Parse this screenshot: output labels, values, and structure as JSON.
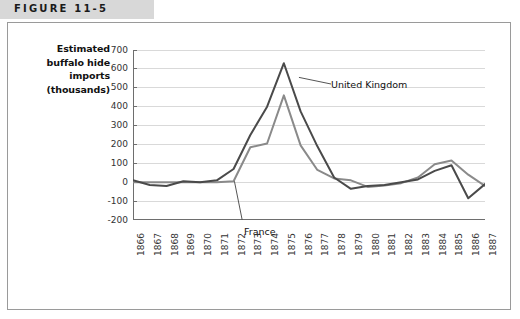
{
  "figure": {
    "label": "FIGURE 11-5"
  },
  "chart_data": {
    "type": "line",
    "title": "",
    "xlabel": "",
    "ylabel": "Estimated buffalo hide imports (thousands)",
    "ylabel_lines": [
      "Estimated",
      "buffalo hide",
      "imports",
      "(thousands)"
    ],
    "categories": [
      "1866",
      "1867",
      "1868",
      "1869",
      "1870",
      "1871",
      "1872",
      "1873",
      "1874",
      "1875",
      "1876",
      "1877",
      "1878",
      "1879",
      "1880",
      "1881",
      "1882",
      "1883",
      "1884",
      "1885",
      "1886",
      "1887"
    ],
    "yticks": [
      700,
      600,
      500,
      400,
      300,
      200,
      100,
      0,
      -100,
      -200
    ],
    "ylim": [
      -200,
      700
    ],
    "grid": true,
    "legend": "annotations",
    "series": [
      {
        "name": "United Kingdom",
        "color": "#4a4a4a",
        "values": [
          10,
          -15,
          -20,
          5,
          0,
          10,
          70,
          250,
          400,
          630,
          375,
          190,
          25,
          -35,
          -20,
          -15,
          0,
          15,
          60,
          90,
          -85,
          -10
        ]
      },
      {
        "name": "France",
        "color": "#8a8a8a",
        "values": [
          0,
          0,
          0,
          0,
          0,
          0,
          5,
          185,
          205,
          460,
          195,
          65,
          20,
          10,
          -25,
          -18,
          -5,
          25,
          95,
          115,
          40,
          -20
        ]
      }
    ],
    "annotations": [
      {
        "text": "United Kingdom",
        "series": "United Kingdom"
      },
      {
        "text": "France",
        "series": "France"
      }
    ]
  },
  "colors": {
    "band": "#d8d8d8",
    "frame": "#9a9a9a",
    "grid": "#d9d9d9",
    "axis": "#6e6e6e",
    "uk_line": "#4a4a4a",
    "france_line": "#8a8a8a"
  }
}
